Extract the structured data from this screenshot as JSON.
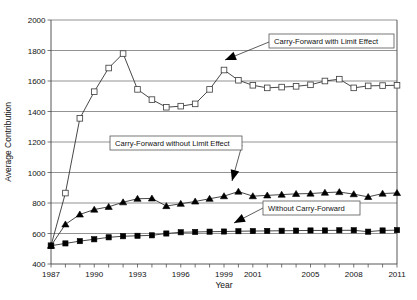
{
  "chart_data": {
    "type": "line",
    "title": "",
    "xlabel": "Year",
    "ylabel": "Average Contribution",
    "xlim": [
      1987,
      2011
    ],
    "ylim": [
      400,
      2000
    ],
    "ytick_step": 200,
    "yticks": [
      400,
      600,
      800,
      1000,
      1200,
      1400,
      1600,
      1800,
      2000
    ],
    "grid": true,
    "legend_position": "inline-callouts",
    "x": [
      1987,
      1988,
      1989,
      1990,
      1991,
      1992,
      1993,
      1994,
      1995,
      1996,
      1997,
      1998,
      1999,
      2000,
      2001,
      2002,
      2003,
      2004,
      2005,
      2006,
      2007,
      2008,
      2009,
      2010,
      2011
    ],
    "xticks": [
      1987,
      1988,
      1989,
      1990,
      1991,
      1992,
      1993,
      1994,
      1995,
      1996,
      1997,
      1998,
      1999,
      2000,
      2001,
      2002,
      2003,
      2004,
      2005,
      2006,
      2007,
      2008,
      2009,
      2010,
      2011
    ],
    "xtick_labels": [
      "1987",
      "",
      "",
      "1990",
      "",
      "",
      "1993",
      "",
      "",
      "1996",
      "",
      "",
      "1999",
      "",
      "2001",
      "",
      "",
      "",
      "2005",
      "",
      "",
      "2008",
      "",
      "",
      "2011"
    ],
    "series": [
      {
        "name": "Carry-Forward with Limit Effect",
        "marker": "open-square",
        "values": [
          520,
          865,
          1355,
          1530,
          1685,
          1780,
          1545,
          1478,
          1428,
          1435,
          1450,
          1545,
          1672,
          1605,
          1572,
          1555,
          1560,
          1565,
          1575,
          1600,
          1612,
          1555,
          1568,
          1570,
          1572
        ]
      },
      {
        "name": "Carry-Forward without Limit Effect",
        "marker": "filled-triangle",
        "values": [
          520,
          660,
          725,
          757,
          775,
          805,
          828,
          830,
          780,
          795,
          810,
          828,
          845,
          875,
          845,
          850,
          855,
          860,
          862,
          868,
          872,
          858,
          840,
          862,
          866
        ]
      },
      {
        "name": "Without Carry-Forward",
        "marker": "filled-square",
        "values": [
          520,
          535,
          550,
          562,
          575,
          582,
          585,
          588,
          600,
          608,
          610,
          612,
          613,
          615,
          616,
          617,
          618,
          619,
          620,
          620,
          621,
          621,
          612,
          620,
          622
        ]
      }
    ],
    "callouts": [
      {
        "id": "callout-with-limit",
        "text": "Carry-Forward with Limit Effect"
      },
      {
        "id": "callout-without-limit",
        "text": "Carry-Forward without Limit Effect"
      },
      {
        "id": "callout-without-cf",
        "text": "Without Carry-Forward"
      }
    ]
  }
}
